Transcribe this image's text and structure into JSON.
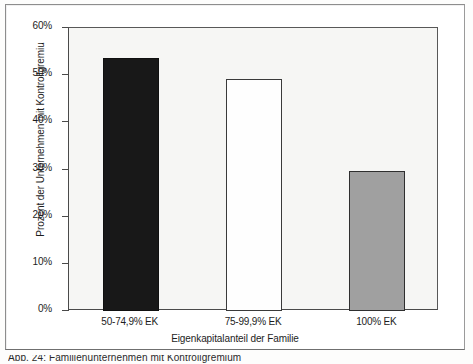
{
  "figure": {
    "y_axis_title": "Prozent der Unternehmen mit Kontrollgremiu",
    "x_axis_title": "Eigenkapitalanteil der Familie",
    "caption": "Abb. 24:  Familienunternehmen mit Kontrollgremium"
  },
  "chart_data": {
    "type": "bar",
    "title": "",
    "subtitle": "",
    "xlabel": "Eigenkapitalanteil der Familie",
    "ylabel": "Prozent der Unternehmen mit Kontrollgremiu",
    "categories": [
      "50-74,9% EK",
      "75-99,9% EK",
      "100% EK"
    ],
    "values": [
      53.6,
      49.1,
      29.7
    ],
    "ylim": [
      0,
      60
    ],
    "ytick_values": [
      0,
      10,
      20,
      30,
      40,
      50,
      60
    ],
    "ytick_labels": [
      "0%",
      "10%",
      "20%",
      "30%",
      "40%",
      "50%",
      "60%"
    ],
    "grid": false,
    "legend": null,
    "bar_colors": [
      "#181818",
      "#fefefe",
      "#a0a0a0"
    ],
    "plot_background": "#f6f6f4",
    "axis_color": "#4a4a4a"
  }
}
